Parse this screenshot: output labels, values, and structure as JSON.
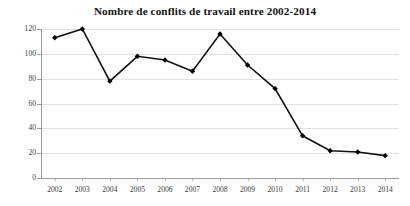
{
  "chart_data": {
    "type": "line",
    "title": "Nombre de conflits de travail entre 2002-2014",
    "subtitle": "",
    "xlabel": "",
    "ylabel": "",
    "categories": [
      "2002",
      "2003",
      "2004",
      "2005",
      "2006",
      "2007",
      "2008",
      "2009",
      "2010",
      "2011",
      "2012",
      "2013",
      "2014"
    ],
    "values": [
      113,
      120,
      78,
      98,
      95,
      86,
      116,
      91,
      72,
      34,
      22,
      21,
      18
    ],
    "series": [
      {
        "name": "Nombre de conflits de travail",
        "values": [
          113,
          120,
          78,
          98,
          95,
          86,
          116,
          91,
          72,
          34,
          22,
          21,
          18
        ]
      }
    ],
    "ylim": [
      0,
      120
    ],
    "yticks": [
      0,
      20,
      40,
      60,
      80,
      100,
      120
    ],
    "ytick_labels": [
      "0",
      "20",
      "40",
      "60",
      "80",
      "100",
      "120"
    ],
    "xtick_labels": [
      "2002",
      "2003",
      "2004",
      "2005",
      "2006",
      "2007",
      "2008",
      "2009",
      "2010",
      "2011",
      "2012",
      "2013",
      "2014"
    ],
    "grid": true,
    "grid_axis": "y",
    "legend": false,
    "legend_position": "none",
    "line_color": "#111111",
    "marker": "diamond",
    "marker_color": "#000000",
    "grid_color": "#e2e2e2",
    "axis_color": "#9a9a9a",
    "background_color": "#ffffff",
    "annotations": []
  }
}
